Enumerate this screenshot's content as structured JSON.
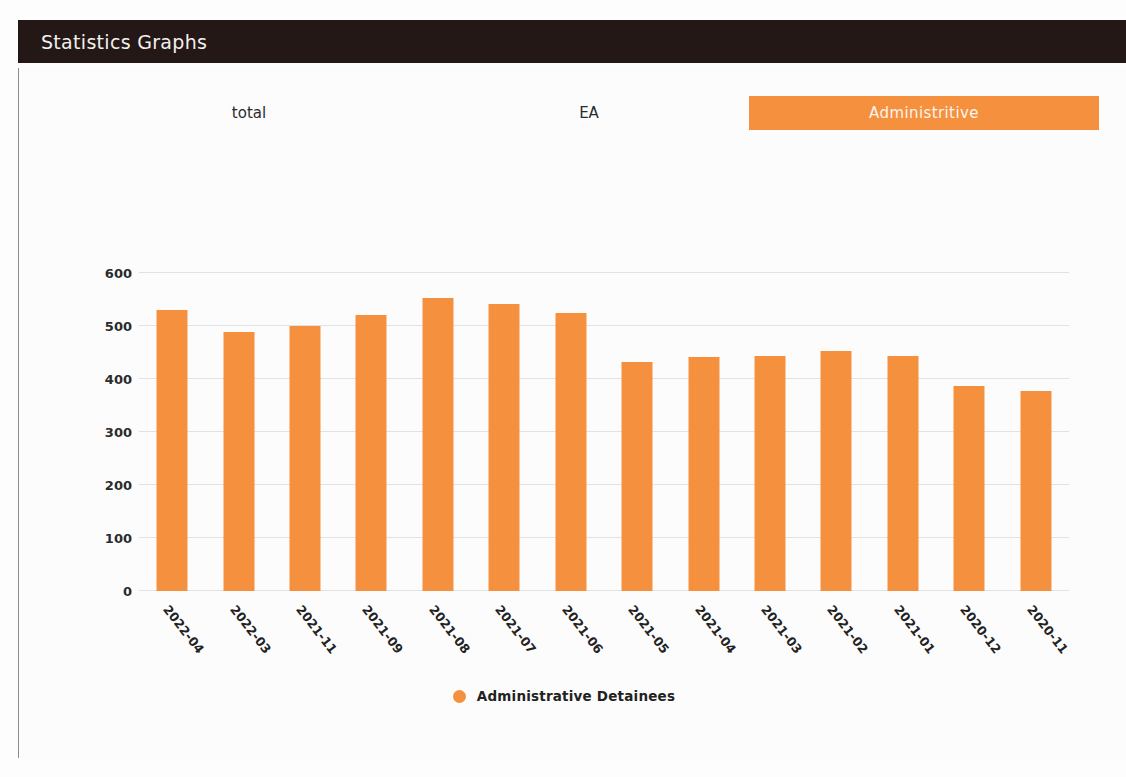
{
  "header": {
    "title": "Statistics Graphs"
  },
  "tabs": [
    {
      "id": "total",
      "label": "total",
      "active": false
    },
    {
      "id": "ea",
      "label": "EA",
      "active": false
    },
    {
      "id": "administritive",
      "label": "Administritive",
      "active": true
    }
  ],
  "colors": {
    "header_background": "#231815",
    "accent": "#f5903e",
    "panel_background": "#fcfcfc",
    "text": "#222222",
    "gridline": "#e2e2e2"
  },
  "chart_data": {
    "type": "bar",
    "title": "",
    "xlabel": "",
    "ylabel": "",
    "ylim": [
      0,
      600
    ],
    "yticks": [
      0,
      100,
      200,
      300,
      400,
      500,
      600
    ],
    "grid": true,
    "legend_position": "bottom",
    "categories": [
      "2022-04",
      "2022-03",
      "2021-11",
      "2021-09",
      "2021-08",
      "2021-07",
      "2021-06",
      "2021-05",
      "2021-04",
      "2021-03",
      "2021-02",
      "2021-01",
      "2020-12",
      "2020-11"
    ],
    "series": [
      {
        "name": "Administrative Detainees",
        "color": "#f5903e",
        "values": [
          531,
          489,
          500,
          521,
          552,
          542,
          524,
          433,
          442,
          443,
          453,
          443,
          387,
          377
        ]
      }
    ]
  }
}
